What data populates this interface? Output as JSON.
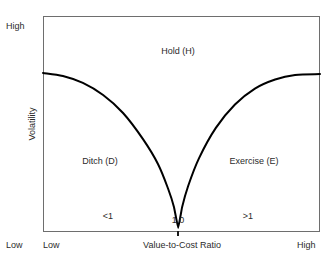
{
  "chart_data": {
    "type": "line",
    "title": "",
    "xlabel": "Value-to-Cost Ratio",
    "ylabel": "Volatility",
    "xlim": [
      0,
      1
    ],
    "ylim": [
      0,
      1
    ],
    "grid": false,
    "legend": null,
    "x_axis": {
      "label": "Value-to-Cost Ratio",
      "low_end_label": "Low",
      "high_end_label": "High",
      "tick_labels": [
        "<1",
        "1.0",
        ">1"
      ],
      "tick_positions": [
        0.235,
        0.488,
        0.74
      ],
      "ticked_value": "1.0",
      "tick_mark_at": 0.488
    },
    "y_axis": {
      "label": "Volatility",
      "low_end_label": "Low",
      "high_end_label": "High"
    },
    "series": [
      {
        "name": "option-space boundary",
        "color": "#000000",
        "description": "V-shaped boundary curve, flat at both outer edges, cusp at value-to-cost ratio 1.0",
        "x": [
          0.0,
          0.072,
          0.144,
          0.217,
          0.289,
          0.361,
          0.415,
          0.452,
          0.473,
          0.488,
          0.502,
          0.524,
          0.563,
          0.624,
          0.693,
          0.765,
          0.838,
          0.91,
          1.0
        ],
        "y": [
          0.736,
          0.722,
          0.69,
          0.634,
          0.551,
          0.43,
          0.315,
          0.199,
          0.115,
          0.019,
          0.114,
          0.213,
          0.341,
          0.482,
          0.59,
          0.664,
          0.706,
          0.727,
          0.731
        ]
      }
    ],
    "annotations": [
      {
        "text": "Hold (H)",
        "x": 0.488,
        "y": 0.845,
        "region": "upper-center"
      },
      {
        "text": "Ditch (D)",
        "x": 0.206,
        "y": 0.287,
        "region": "lower-left"
      },
      {
        "text": "Exercise (E)",
        "x": 0.762,
        "y": 0.287,
        "region": "lower-right"
      }
    ]
  },
  "figure": {
    "y_axis_top_label": "High",
    "y_axis_bottom_label": "Low",
    "y_axis_title": "Volatility",
    "x_axis_left_label": "Low",
    "x_axis_right_label": "High",
    "x_axis_title": "Value-to-Cost Ratio",
    "tick_lt1": "<1",
    "tick_one": "1.0",
    "tick_gt1": ">1",
    "region_hold": "Hold (H)",
    "region_ditch": "Ditch (D)",
    "region_exercise": "Exercise (E)",
    "colors": {
      "curve": "#000000",
      "frame": "#6e6e6e",
      "text": "#2b2b2b",
      "background": "#ffffff"
    }
  }
}
